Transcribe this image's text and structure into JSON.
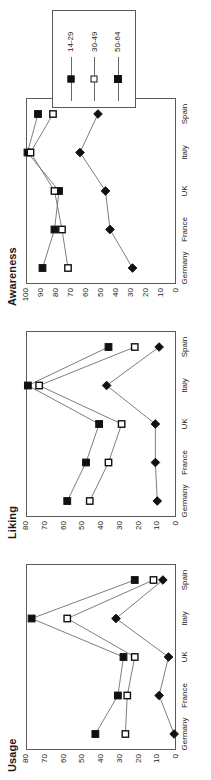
{
  "figure": {
    "legend": {
      "position": "top-right",
      "entries": [
        {
          "label": "14-29",
          "marker": "filled-square"
        },
        {
          "label": "30-49",
          "marker": "open-square"
        },
        {
          "label": "50-64",
          "marker": "filled-diamond"
        }
      ]
    }
  },
  "chart_data": [
    {
      "type": "line",
      "title": "Awareness",
      "xlabel": "",
      "ylabel": "",
      "categories": [
        "Germany",
        "France",
        "UK",
        "Italy",
        "Spain"
      ],
      "ylim": [
        0,
        100
      ],
      "yticks": [
        0,
        10,
        20,
        30,
        40,
        50,
        60,
        70,
        80,
        90,
        100
      ],
      "grid": false,
      "legend_position": "top-right",
      "series": [
        {
          "name": "14-29",
          "marker": "filled-square",
          "values": [
            89,
            81,
            78,
            99,
            92
          ]
        },
        {
          "name": "30-49",
          "marker": "open-square",
          "values": [
            72,
            76,
            81,
            97,
            82
          ]
        },
        {
          "name": "50-64",
          "marker": "filled-diamond",
          "values": [
            29,
            44,
            47,
            64,
            52
          ]
        }
      ]
    },
    {
      "type": "line",
      "title": "Liking",
      "xlabel": "",
      "ylabel": "",
      "categories": [
        "Germany",
        "France",
        "UK",
        "Italy",
        "Spain"
      ],
      "ylim": [
        0,
        80
      ],
      "yticks": [
        0,
        10,
        20,
        30,
        40,
        50,
        60,
        70,
        80
      ],
      "grid": false,
      "legend_position": "top-right",
      "series": [
        {
          "name": "14-29",
          "marker": "filled-square",
          "values": [
            58,
            48,
            41,
            79,
            36
          ]
        },
        {
          "name": "30-49",
          "marker": "open-square",
          "values": [
            46,
            36,
            29,
            73,
            22
          ]
        },
        {
          "name": "50-64",
          "marker": "filled-diamond",
          "values": [
            10,
            11,
            11,
            37,
            9
          ]
        }
      ]
    },
    {
      "type": "line",
      "title": "Usage",
      "xlabel": "",
      "ylabel": "",
      "categories": [
        "Germany",
        "France",
        "UK",
        "Italy",
        "Spain"
      ],
      "ylim": [
        0,
        80
      ],
      "yticks": [
        0,
        10,
        20,
        30,
        40,
        50,
        60,
        70,
        80
      ],
      "grid": false,
      "legend_position": "top-right",
      "series": [
        {
          "name": "14-29",
          "marker": "filled-square",
          "values": [
            43,
            31,
            28,
            77,
            22
          ]
        },
        {
          "name": "30-49",
          "marker": "open-square",
          "values": [
            27,
            26,
            22,
            58,
            12
          ]
        },
        {
          "name": "50-64",
          "marker": "filled-diamond",
          "values": [
            1,
            9,
            4,
            32,
            7
          ]
        }
      ]
    }
  ]
}
